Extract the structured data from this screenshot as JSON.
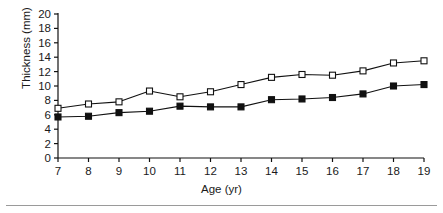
{
  "chart_data": {
    "type": "line",
    "title": "",
    "subtitle": "",
    "xlabel": "Age (yr)",
    "ylabel": "Thickness (mm)",
    "x": [
      7,
      8,
      9,
      10,
      11,
      12,
      13,
      14,
      15,
      16,
      17,
      18,
      19
    ],
    "categories": [
      "7",
      "8",
      "9",
      "10",
      "11",
      "12",
      "13",
      "14",
      "15",
      "16",
      "17",
      "18",
      "19"
    ],
    "xlim": [
      7,
      19
    ],
    "ylim": [
      0,
      20
    ],
    "xticks": [
      7,
      8,
      9,
      10,
      11,
      12,
      13,
      14,
      15,
      16,
      17,
      18,
      19
    ],
    "yticks": [
      0,
      2,
      4,
      6,
      8,
      10,
      12,
      14,
      16,
      18,
      20
    ],
    "xtick_labels": [
      "7",
      "8",
      "9",
      "10",
      "11",
      "12",
      "13",
      "14",
      "15",
      "16",
      "17",
      "18",
      "19"
    ],
    "ytick_labels": [
      "0",
      "2",
      "4",
      "6",
      "8",
      "10",
      "12",
      "14",
      "16",
      "18",
      "20"
    ],
    "grid": false,
    "legend": false,
    "legend_position": "none",
    "series": [
      {
        "name": "open-square-series",
        "marker": "open-square",
        "marker_fill": "#ffffff",
        "marker_edge": "#111111",
        "line_color": "#111111",
        "values": [
          6.9,
          7.5,
          7.8,
          9.3,
          8.5,
          9.2,
          10.2,
          11.2,
          11.6,
          11.5,
          12.1,
          13.2,
          13.5
        ]
      },
      {
        "name": "filled-square-series",
        "marker": "filled-square",
        "marker_fill": "#111111",
        "marker_edge": "#111111",
        "line_color": "#111111",
        "values": [
          5.7,
          5.8,
          6.3,
          6.5,
          7.2,
          7.1,
          7.1,
          8.1,
          8.2,
          8.4,
          8.9,
          10.0,
          10.2
        ]
      }
    ],
    "annotations": [],
    "colors": {
      "axis": "#111111",
      "line": "#111111",
      "background": "#ffffff",
      "footer_rule": "#9a9a9a"
    }
  }
}
